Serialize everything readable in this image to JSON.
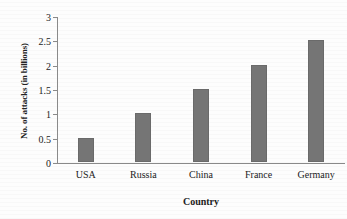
{
  "chart_data": {
    "type": "bar",
    "title": "",
    "xlabel": "Country",
    "ylabel": "No. of attacks (in billions)",
    "categories": [
      "USA",
      "Russia",
      "China",
      "France",
      "Germany"
    ],
    "values": [
      0.5,
      1.0,
      1.5,
      2.0,
      2.5
    ],
    "ylim": [
      0,
      3
    ],
    "ytick_labels": [
      "0",
      "0.5",
      "1",
      "1.5",
      "2",
      "2.5",
      "3"
    ],
    "ytick_values": [
      0,
      0.5,
      1,
      1.5,
      2,
      2.5,
      3
    ],
    "grid": false,
    "legend": "none",
    "bar_color": "#757575",
    "axis_color": "#8a8a8a",
    "background_color": "#fdfdfd",
    "series": [
      {
        "name": "No. of attacks (in billions)",
        "values": [
          0.5,
          1.0,
          1.5,
          2.0,
          2.5
        ]
      }
    ]
  }
}
